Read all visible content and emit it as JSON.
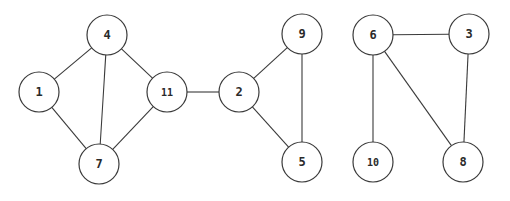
{
  "diagram": {
    "type": "undirected-graph",
    "node_radius": 20,
    "colors": {
      "background": "#ffffff",
      "stroke": "#3a3a3a",
      "text": "#2a2a2a"
    },
    "nodes": [
      {
        "id": "4",
        "label": "4",
        "x": 107,
        "y": 35
      },
      {
        "id": "1",
        "label": "1",
        "x": 39,
        "y": 92
      },
      {
        "id": "7",
        "label": "7",
        "x": 99,
        "y": 164
      },
      {
        "id": "11",
        "label": "11",
        "x": 167,
        "y": 92
      },
      {
        "id": "2",
        "label": "2",
        "x": 239,
        "y": 92
      },
      {
        "id": "9",
        "label": "9",
        "x": 302,
        "y": 34
      },
      {
        "id": "5",
        "label": "5",
        "x": 302,
        "y": 162
      },
      {
        "id": "6",
        "label": "6",
        "x": 373,
        "y": 35
      },
      {
        "id": "3",
        "label": "3",
        "x": 469,
        "y": 34
      },
      {
        "id": "10",
        "label": "10",
        "x": 373,
        "y": 162
      },
      {
        "id": "8",
        "label": "8",
        "x": 463,
        "y": 162
      }
    ],
    "edges": [
      {
        "from": "4",
        "to": "1"
      },
      {
        "from": "4",
        "to": "7"
      },
      {
        "from": "4",
        "to": "11"
      },
      {
        "from": "1",
        "to": "7"
      },
      {
        "from": "7",
        "to": "11"
      },
      {
        "from": "11",
        "to": "2"
      },
      {
        "from": "2",
        "to": "9"
      },
      {
        "from": "2",
        "to": "5"
      },
      {
        "from": "9",
        "to": "5"
      },
      {
        "from": "6",
        "to": "3"
      },
      {
        "from": "6",
        "to": "10"
      },
      {
        "from": "6",
        "to": "8"
      },
      {
        "from": "3",
        "to": "8"
      }
    ]
  }
}
